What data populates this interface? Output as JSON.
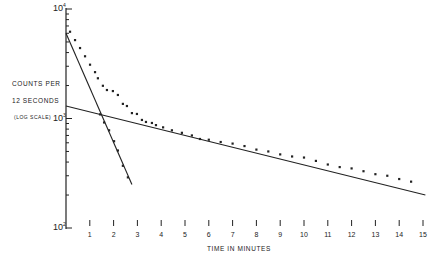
{
  "chart_data": {
    "type": "scatter",
    "title": "",
    "xlabel": "TIME IN MINUTES",
    "ylabel": [
      "COUNTS PER",
      "12 SECONDS",
      "(LOG SCALE)"
    ],
    "yscale": "log",
    "xlim": [
      0,
      15.2
    ],
    "ylim": [
      100,
      10000
    ],
    "x_ticks": [
      1,
      2,
      3,
      4,
      5,
      6,
      7,
      8,
      9,
      10,
      11,
      12,
      13,
      14,
      15
    ],
    "y_ticks": [
      {
        "value": 10000,
        "label": "10",
        "exp": "4"
      },
      {
        "value": 1000,
        "label": "10",
        "exp": "3"
      },
      {
        "value": 100,
        "label": "10",
        "exp": "2"
      }
    ],
    "grid": false,
    "legend": null,
    "series": [
      {
        "name": "total counts (observed)",
        "style": "dots",
        "x": [
          0.17,
          0.38,
          0.59,
          0.8,
          1.01,
          1.22,
          1.34,
          1.55,
          1.72,
          1.97,
          2.18,
          2.39,
          2.56,
          2.77,
          2.98,
          3.19,
          3.36,
          3.61,
          3.78,
          4.08,
          4.45,
          4.87,
          5.29,
          5.63,
          6.0,
          6.5,
          7.0,
          7.5,
          8.0,
          8.5,
          9.0,
          9.5,
          10.0,
          10.5,
          11.0,
          11.5,
          12.0,
          12.5,
          13.0,
          13.5,
          14.0,
          14.5
        ],
        "y": [
          6200,
          5200,
          4400,
          3700,
          3100,
          2650,
          2330,
          1990,
          1820,
          1780,
          1640,
          1360,
          1300,
          1120,
          1100,
          970,
          930,
          910,
          870,
          830,
          780,
          740,
          700,
          650,
          640,
          610,
          590,
          560,
          520,
          500,
          470,
          450,
          440,
          410,
          380,
          360,
          350,
          330,
          310,
          300,
          280,
          265
        ]
      },
      {
        "name": "short-lived component (subtracted)",
        "style": "dots",
        "x": [
          1.43,
          1.6,
          1.81,
          2.02,
          2.18,
          2.39,
          2.6
        ],
        "y": [
          1090,
          920,
          780,
          620,
          510,
          370,
          290
        ]
      },
      {
        "name": "fast decay fit",
        "style": "line",
        "x": [
          0,
          2.77
        ],
        "y": [
          6000,
          250
        ]
      },
      {
        "name": "slow decay fit",
        "style": "line",
        "x": [
          0,
          15.1
        ],
        "y": [
          1300,
          200
        ]
      }
    ]
  }
}
